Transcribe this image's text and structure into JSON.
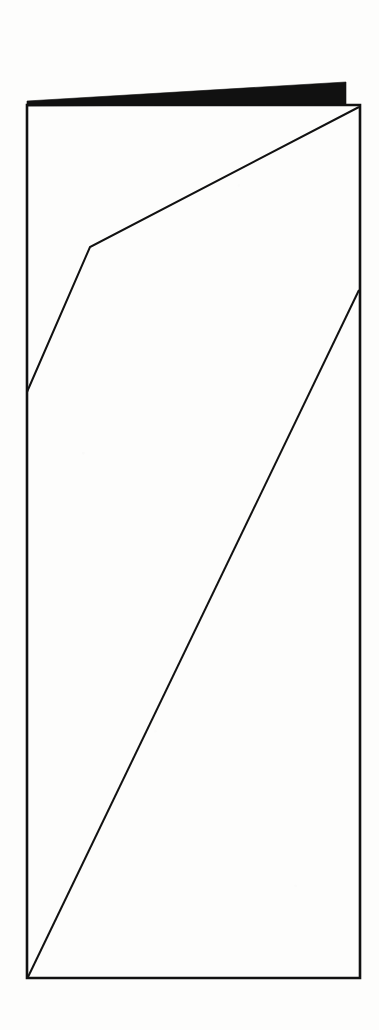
{
  "page": {
    "width": 379,
    "height": 1030,
    "background_color": "#fdfdfc",
    "ink_color": "#111111",
    "caption": ""
  },
  "drawing": {
    "stroke_color": "#111111",
    "fill_color": "#111111",
    "frame_stroke_width": 2.6,
    "line_stroke_width": 2.0,
    "frame": {
      "name": "outer-rectangle",
      "left": 27,
      "top": 105,
      "right": 360,
      "bottom": 978,
      "points": "27,105 360,105 360,978 27,978"
    },
    "black_band": {
      "name": "solid-black-wedge",
      "description": "solid black tapered band along the top edge, thin at left, thick at right",
      "points": "27,101 346,82 346,104 27,106"
    },
    "polyline_upper": {
      "name": "upper-bent-polyline",
      "description": "two segment line: from left edge up to a vertex then up to the top-right corner",
      "points": "27,392 90,247 359,107"
    },
    "diagonal_long": {
      "name": "long-diagonal-line",
      "description": "single straight line from bottom-left corner up to the right edge",
      "points": "28,977 359,290"
    },
    "vertices": [
      {
        "name": "left-edge-junction",
        "x": 27,
        "y": 392
      },
      {
        "name": "polyline-bend-vertex",
        "x": 90,
        "y": 247
      },
      {
        "name": "top-right-corner",
        "x": 359,
        "y": 107
      },
      {
        "name": "bottom-left-corner",
        "x": 28,
        "y": 977
      },
      {
        "name": "right-edge-junction",
        "x": 359,
        "y": 290
      },
      {
        "name": "band-right-end",
        "x": 346,
        "y": 82
      }
    ]
  }
}
